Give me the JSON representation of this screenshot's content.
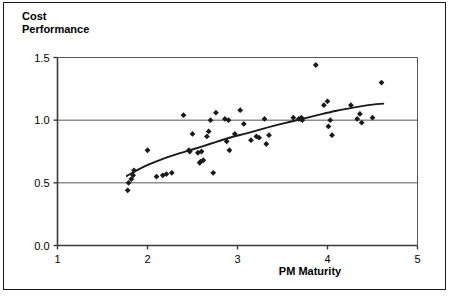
{
  "chart_data": {
    "type": "scatter",
    "title": "Cost\nPerformance",
    "xlabel": "PM Maturity",
    "ylabel": "Cost Performance",
    "xlim": [
      1,
      5
    ],
    "ylim": [
      0.0,
      1.5
    ],
    "xticks": [
      "1",
      "2",
      "3",
      "4",
      "5"
    ],
    "yticks": [
      "0.0",
      "0.5",
      "1.0",
      "1.5"
    ],
    "xtick_values": [
      1,
      2,
      3,
      4,
      5
    ],
    "ytick_values": [
      0.0,
      0.5,
      1.0,
      1.5
    ],
    "grid": "horizontal",
    "legend": "none",
    "marker": "diamond",
    "marker_color": "#1a1a1a",
    "trend_color": "#1a1a1a",
    "points": [
      [
        1.78,
        0.44
      ],
      [
        1.79,
        0.5
      ],
      [
        1.82,
        0.53
      ],
      [
        1.84,
        0.56
      ],
      [
        1.85,
        0.6
      ],
      [
        2.0,
        0.76
      ],
      [
        2.1,
        0.55
      ],
      [
        2.17,
        0.56
      ],
      [
        2.21,
        0.57
      ],
      [
        2.27,
        0.58
      ],
      [
        2.4,
        1.04
      ],
      [
        2.46,
        0.76
      ],
      [
        2.47,
        0.75
      ],
      [
        2.5,
        0.89
      ],
      [
        2.56,
        0.74
      ],
      [
        2.58,
        0.66
      ],
      [
        2.59,
        0.67
      ],
      [
        2.6,
        0.75
      ],
      [
        2.62,
        0.68
      ],
      [
        2.66,
        0.87
      ],
      [
        2.68,
        0.91
      ],
      [
        2.7,
        1.0
      ],
      [
        2.73,
        0.58
      ],
      [
        2.76,
        1.06
      ],
      [
        2.86,
        1.01
      ],
      [
        2.88,
        0.83
      ],
      [
        2.9,
        1.0
      ],
      [
        2.91,
        0.76
      ],
      [
        2.97,
        0.89
      ],
      [
        3.03,
        1.08
      ],
      [
        3.07,
        0.97
      ],
      [
        3.15,
        0.84
      ],
      [
        3.21,
        0.87
      ],
      [
        3.24,
        0.86
      ],
      [
        3.3,
        1.01
      ],
      [
        3.32,
        0.81
      ],
      [
        3.35,
        0.88
      ],
      [
        3.62,
        1.02
      ],
      [
        3.68,
        1.01
      ],
      [
        3.7,
        1.01
      ],
      [
        3.71,
        1.02
      ],
      [
        3.72,
        1.0
      ],
      [
        3.87,
        1.44
      ],
      [
        3.96,
        1.12
      ],
      [
        4.0,
        1.15
      ],
      [
        4.01,
        0.95
      ],
      [
        4.03,
        1.0
      ],
      [
        4.05,
        0.88
      ],
      [
        4.26,
        1.12
      ],
      [
        4.33,
        1.01
      ],
      [
        4.36,
        1.05
      ],
      [
        4.38,
        0.98
      ],
      [
        4.5,
        1.02
      ],
      [
        4.6,
        1.3
      ]
    ],
    "trendline": [
      [
        1.77,
        0.555
      ],
      [
        1.95,
        0.625
      ],
      [
        2.15,
        0.685
      ],
      [
        2.35,
        0.735
      ],
      [
        2.48,
        0.762
      ],
      [
        2.7,
        0.812
      ],
      [
        2.9,
        0.858
      ],
      [
        3.1,
        0.895
      ],
      [
        3.3,
        0.935
      ],
      [
        3.5,
        0.972
      ],
      [
        3.7,
        1.007
      ],
      [
        3.9,
        1.042
      ],
      [
        4.1,
        1.075
      ],
      [
        4.3,
        1.102
      ],
      [
        4.45,
        1.12
      ],
      [
        4.62,
        1.132
      ]
    ]
  }
}
